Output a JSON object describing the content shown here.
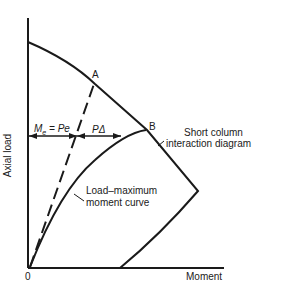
{
  "diagram": {
    "axes": {
      "y_label": "Axial load",
      "x_label": "Moment",
      "origin_label": "0"
    },
    "points": {
      "a_label": "A",
      "b_label": "B"
    },
    "annotations": {
      "me_eq": "M",
      "me_sub": "e",
      "me_rest": " = Pe",
      "p_delta": "PΔ",
      "interaction_line1": "Short column",
      "interaction_line2": "interaction diagram",
      "loadmax_line1": "Load–maximum",
      "loadmax_line2": "moment curve"
    },
    "colors": {
      "ink": "#1a1a1a",
      "background": "#ffffff"
    }
  }
}
